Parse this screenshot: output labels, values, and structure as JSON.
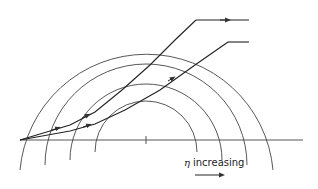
{
  "diagram": {
    "center": [
      146,
      140
    ],
    "radii": [
      51,
      76,
      101,
      127
    ],
    "axis": {
      "x1": 20,
      "x2": 303,
      "y": 140,
      "center_tick_x": 146
    },
    "rays": [
      {
        "name": "upper-ray",
        "points": [
          [
            20,
            140
          ],
          [
            70,
            125
          ],
          [
            95,
            112
          ],
          [
            122,
            90
          ],
          [
            150,
            65
          ],
          [
            175,
            40
          ],
          [
            196,
            20
          ]
        ],
        "exit": [
          [
            196,
            20
          ],
          [
            249,
            20
          ]
        ]
      },
      {
        "name": "lower-ray",
        "points": [
          [
            20,
            140
          ],
          [
            70,
            131
          ],
          [
            95,
            124
          ],
          [
            125,
            110
          ],
          [
            160,
            90
          ],
          [
            195,
            65
          ],
          [
            228,
            42
          ]
        ],
        "exit": [
          [
            228,
            42
          ],
          [
            249,
            42
          ]
        ]
      }
    ],
    "label": {
      "symbol": "η",
      "text": "increasing",
      "arrow": "→"
    },
    "stroke_color": "#333333",
    "background": "#ffffff"
  }
}
